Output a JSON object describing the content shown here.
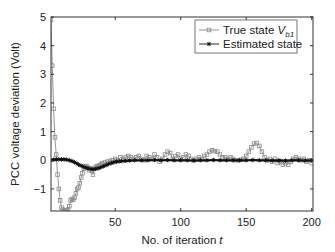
{
  "chart_data": {
    "type": "line",
    "title": "",
    "xlabel": "No. of iteration",
    "xlabel_var": "t",
    "ylabel": "PCC voltage deviation (Volt)",
    "xlim": [
      1,
      201
    ],
    "ylim": [
      -1.77,
      5
    ],
    "xticks": [
      50,
      100,
      150,
      200
    ],
    "yticks": [
      -1,
      0,
      1,
      2,
      3,
      4,
      5
    ],
    "grid": false,
    "legend_position": "upper right",
    "legend": [
      {
        "label": "True  state ",
        "sub_var": "V",
        "sub": "b1",
        "marker": "square",
        "color": "#8a8a8a"
      },
      {
        "label": "Estimated state",
        "marker": "star",
        "color": "#111111"
      }
    ],
    "series": [
      {
        "name": "True state V_b1",
        "color": "#8a8a8a",
        "marker": "square",
        "points": [
          [
            1,
            4.9
          ],
          [
            2,
            3.3
          ],
          [
            3,
            1.8
          ],
          [
            4,
            0.8
          ],
          [
            5,
            0.2
          ],
          [
            6,
            -0.5
          ],
          [
            7,
            -1.0
          ],
          [
            8,
            -1.4
          ],
          [
            9,
            -1.65
          ],
          [
            10,
            -1.72
          ],
          [
            11,
            -1.75
          ],
          [
            12,
            -1.76
          ],
          [
            13,
            -1.75
          ],
          [
            14,
            -1.72
          ],
          [
            15,
            -1.6
          ],
          [
            16,
            -1.4
          ],
          [
            17,
            -1.35
          ],
          [
            18,
            -1.38
          ],
          [
            19,
            -1.3
          ],
          [
            20,
            -1.15
          ],
          [
            21,
            -1.0
          ],
          [
            22,
            -0.95
          ],
          [
            23,
            -0.8
          ],
          [
            24,
            -0.6
          ],
          [
            25,
            -0.45
          ],
          [
            26,
            -0.3
          ],
          [
            27,
            -0.22
          ],
          [
            28,
            -0.2
          ],
          [
            29,
            -0.25
          ],
          [
            30,
            -0.35
          ],
          [
            31,
            -0.28
          ],
          [
            32,
            -0.35
          ],
          [
            33,
            -0.5
          ],
          [
            34,
            -0.3
          ],
          [
            35,
            -0.25
          ],
          [
            36,
            -0.2
          ],
          [
            37,
            -0.22
          ],
          [
            38,
            -0.18
          ],
          [
            39,
            -0.15
          ],
          [
            40,
            -0.1
          ],
          [
            42,
            -0.08
          ],
          [
            44,
            -0.05
          ],
          [
            46,
            -0.02
          ],
          [
            48,
            0.0
          ],
          [
            50,
            0.05
          ],
          [
            52,
            0.0
          ],
          [
            54,
            0.1
          ],
          [
            56,
            0.05
          ],
          [
            58,
            0.1
          ],
          [
            60,
            0.15
          ],
          [
            62,
            0.1
          ],
          [
            64,
            0.05
          ],
          [
            66,
            0.1
          ],
          [
            68,
            0.15
          ],
          [
            70,
            0.05
          ],
          [
            72,
            0.0
          ],
          [
            74,
            0.15
          ],
          [
            76,
            0.1
          ],
          [
            78,
            0.05
          ],
          [
            80,
            0.2
          ],
          [
            82,
            0.1
          ],
          [
            84,
            -0.05
          ],
          [
            86,
            0.05
          ],
          [
            88,
            0.2
          ],
          [
            90,
            0.3
          ],
          [
            92,
            0.25
          ],
          [
            94,
            0.05
          ],
          [
            96,
            0.15
          ],
          [
            98,
            0.2
          ],
          [
            100,
            0.05
          ],
          [
            102,
            0.1
          ],
          [
            104,
            0.2
          ],
          [
            106,
            0.15
          ],
          [
            108,
            0.05
          ],
          [
            110,
            0.0
          ],
          [
            112,
            0.05
          ],
          [
            114,
            0.1
          ],
          [
            116,
            0.05
          ],
          [
            118,
            0.15
          ],
          [
            120,
            0.2
          ],
          [
            122,
            0.3
          ],
          [
            124,
            0.35
          ],
          [
            126,
            0.32
          ],
          [
            128,
            0.3
          ],
          [
            130,
            0.2
          ],
          [
            132,
            0.1
          ],
          [
            134,
            0.1
          ],
          [
            136,
            0.05
          ],
          [
            138,
            0.1
          ],
          [
            140,
            0.05
          ],
          [
            142,
            0.0
          ],
          [
            144,
            0.0
          ],
          [
            146,
            0.02
          ],
          [
            148,
            0.05
          ],
          [
            150,
            0.15
          ],
          [
            152,
            0.3
          ],
          [
            154,
            0.45
          ],
          [
            156,
            0.58
          ],
          [
            158,
            0.6
          ],
          [
            160,
            0.5
          ],
          [
            162,
            0.3
          ],
          [
            164,
            0.1
          ],
          [
            166,
            0.0
          ],
          [
            168,
            0.05
          ],
          [
            170,
            -0.05
          ],
          [
            172,
            0.05
          ],
          [
            174,
            -0.1
          ],
          [
            176,
            -0.05
          ],
          [
            178,
            -0.15
          ],
          [
            180,
            -0.1
          ],
          [
            182,
            -0.15
          ],
          [
            184,
            -0.05
          ],
          [
            186,
            0.05
          ],
          [
            188,
            0.1
          ],
          [
            190,
            0.05
          ],
          [
            192,
            0.0
          ],
          [
            194,
            0.05
          ],
          [
            196,
            -0.05
          ],
          [
            198,
            0.0
          ],
          [
            200,
            -0.1
          ]
        ]
      },
      {
        "name": "Estimated state",
        "color": "#111111",
        "marker": "star",
        "points": [
          [
            1,
            0.0
          ],
          [
            3,
            0.02
          ],
          [
            5,
            0.03
          ],
          [
            7,
            0.03
          ],
          [
            9,
            0.03
          ],
          [
            11,
            0.03
          ],
          [
            13,
            0.02
          ],
          [
            15,
            0.0
          ],
          [
            17,
            -0.03
          ],
          [
            19,
            -0.07
          ],
          [
            21,
            -0.12
          ],
          [
            23,
            -0.17
          ],
          [
            25,
            -0.21
          ],
          [
            27,
            -0.25
          ],
          [
            29,
            -0.28
          ],
          [
            31,
            -0.3
          ],
          [
            33,
            -0.31
          ],
          [
            35,
            -0.3
          ],
          [
            37,
            -0.28
          ],
          [
            39,
            -0.25
          ],
          [
            41,
            -0.21
          ],
          [
            43,
            -0.17
          ],
          [
            45,
            -0.13
          ],
          [
            47,
            -0.1
          ],
          [
            49,
            -0.07
          ],
          [
            51,
            -0.05
          ],
          [
            53,
            -0.04
          ],
          [
            55,
            -0.03
          ],
          [
            58,
            -0.02
          ],
          [
            61,
            -0.01
          ],
          [
            65,
            0.0
          ],
          [
            70,
            0.0
          ],
          [
            75,
            0.0
          ],
          [
            80,
            0.01
          ],
          [
            85,
            0.0
          ],
          [
            90,
            0.01
          ],
          [
            95,
            0.0
          ],
          [
            100,
            0.0
          ],
          [
            105,
            0.0
          ],
          [
            110,
            -0.01
          ],
          [
            115,
            0.0
          ],
          [
            120,
            0.0
          ],
          [
            125,
            0.01
          ],
          [
            130,
            0.0
          ],
          [
            135,
            0.0
          ],
          [
            140,
            0.0
          ],
          [
            145,
            0.0
          ],
          [
            150,
            0.0
          ],
          [
            155,
            0.01
          ],
          [
            160,
            0.0
          ],
          [
            165,
            0.0
          ],
          [
            170,
            -0.01
          ],
          [
            175,
            0.0
          ],
          [
            180,
            -0.01
          ],
          [
            185,
            0.0
          ],
          [
            190,
            0.0
          ],
          [
            195,
            -0.01
          ],
          [
            200,
            0.0
          ]
        ]
      }
    ]
  }
}
